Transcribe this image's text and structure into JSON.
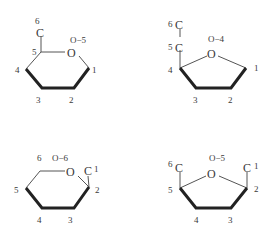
{
  "diagram": {
    "type": "chemical-structures",
    "structures": [
      {
        "id": "pyranose-top-left",
        "ring": "6-membered",
        "ring_oxygen_label": "O",
        "annotation": "O−5",
        "substituent": "C",
        "labels": [
          "6",
          "5",
          "4",
          "3",
          "2",
          "1"
        ]
      },
      {
        "id": "furanose-top-right",
        "ring": "5-membered",
        "ring_oxygen_label": "O",
        "annotation": "O−4",
        "substituents": [
          "C",
          "C"
        ],
        "labels": [
          "6",
          "5",
          "4",
          "3",
          "2",
          "1"
        ]
      },
      {
        "id": "pyranose-bottom-left",
        "ring": "6-membered",
        "ring_oxygen_label": "O",
        "annotation": "O−6",
        "substituent": "C",
        "labels": [
          "6",
          "1",
          "2",
          "5",
          "4",
          "3"
        ]
      },
      {
        "id": "furanose-bottom-right",
        "ring": "5-membered",
        "ring_oxygen_label": "O",
        "annotation": "O−5",
        "substituents": [
          "C",
          "C"
        ],
        "labels": [
          "6",
          "1",
          "5",
          "2",
          "4",
          "3"
        ]
      }
    ]
  }
}
